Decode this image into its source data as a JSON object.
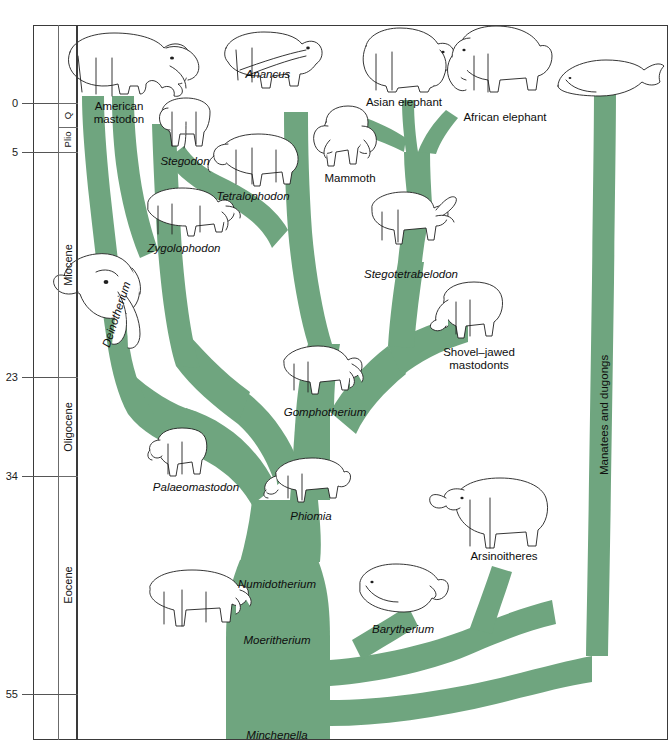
{
  "figure": {
    "kind": "phylogenetic-tree",
    "tree_color": "#6fa57f",
    "ink_color": "#1b1b1b"
  },
  "time_axis": {
    "unit_note": "millions of years ago",
    "ticks": [
      {
        "label": "0",
        "value": 0,
        "y": 103
      },
      {
        "label": "5",
        "value": 5,
        "y": 152
      },
      {
        "label": "23",
        "value": 23,
        "y": 377
      },
      {
        "label": "34",
        "value": 34,
        "y": 476
      },
      {
        "label": "55",
        "value": 55,
        "y": 694
      }
    ],
    "epochs": [
      {
        "label": "Q",
        "top": 103,
        "bottom": 127,
        "small": true
      },
      {
        "label": "Plio",
        "top": 127,
        "bottom": 152,
        "small": true
      },
      {
        "label": "Miocene",
        "top": 152,
        "bottom": 377,
        "small": false
      },
      {
        "label": "Oligocene",
        "top": 377,
        "bottom": 476,
        "small": false
      },
      {
        "label": "Eocene",
        "top": 476,
        "bottom": 694,
        "small": false
      }
    ]
  },
  "taxa": [
    {
      "name": "American\nmastodon",
      "italic": false,
      "x": 119,
      "y": 100,
      "align": "center"
    },
    {
      "name": "Anancus",
      "italic": true,
      "x": 268,
      "y": 68,
      "align": "center"
    },
    {
      "name": "Asian elephant",
      "italic": false,
      "x": 404,
      "y": 96,
      "align": "center"
    },
    {
      "name": "African elephant",
      "italic": false,
      "x": 505,
      "y": 111,
      "align": "center"
    },
    {
      "name": "Stegodon",
      "italic": true,
      "x": 185,
      "y": 155,
      "align": "center"
    },
    {
      "name": "Mammoth",
      "italic": false,
      "x": 350,
      "y": 172,
      "align": "center"
    },
    {
      "name": "Tetralophodon",
      "italic": true,
      "x": 253,
      "y": 190,
      "align": "center"
    },
    {
      "name": "Zygolophodon",
      "italic": true,
      "x": 184,
      "y": 242,
      "align": "center"
    },
    {
      "name": "Stegotetrabelodon",
      "italic": true,
      "x": 411,
      "y": 268,
      "align": "center"
    },
    {
      "name": "Shovel–jawed\nmastodonts",
      "italic": false,
      "x": 479,
      "y": 346,
      "align": "center"
    },
    {
      "name": "Gomphotherium",
      "italic": true,
      "x": 325,
      "y": 406,
      "align": "center"
    },
    {
      "name": "Palaeomastodon",
      "italic": true,
      "x": 196,
      "y": 481,
      "align": "center"
    },
    {
      "name": "Phiomia",
      "italic": true,
      "x": 311,
      "y": 510,
      "align": "center"
    },
    {
      "name": "Arsinoitheres",
      "italic": false,
      "x": 504,
      "y": 550,
      "align": "center"
    },
    {
      "name": "Numidotherium",
      "italic": true,
      "x": 277,
      "y": 578,
      "align": "center"
    },
    {
      "name": "Barytherium",
      "italic": true,
      "x": 403,
      "y": 623,
      "align": "center"
    },
    {
      "name": "Moeritherium",
      "italic": true,
      "x": 277,
      "y": 634,
      "align": "center"
    },
    {
      "name": "Minchenella",
      "italic": true,
      "x": 277,
      "y": 729,
      "align": "center"
    },
    {
      "name": "Deinotherium",
      "italic": true,
      "x": 100,
      "y": 345,
      "align": "rotated",
      "rotate": -72
    },
    {
      "name": "Manatees and dugongs",
      "italic": false,
      "x": 598,
      "y": 475,
      "align": "vertical"
    }
  ],
  "chart_data": {
    "type": "tree",
    "xlabel": "",
    "ylabel": "Millions of years ago",
    "ylim": [
      0,
      58
    ],
    "grid": false,
    "legend": "none",
    "lineages": [
      {
        "name": "American mastodon",
        "first_appearance": 23,
        "last": 0
      },
      {
        "name": "Zygolophodon",
        "first_appearance": 23,
        "last": 10
      },
      {
        "name": "Stegodon",
        "first_appearance": 12,
        "last": 1
      },
      {
        "name": "Tetralophodon",
        "first_appearance": 14,
        "last": 5
      },
      {
        "name": "Anancus",
        "first_appearance": 12,
        "last": 2
      },
      {
        "name": "Gomphotherium",
        "first_appearance": 23,
        "last": 10
      },
      {
        "name": "Shovel-jawed mastodonts",
        "first_appearance": 20,
        "last": 8
      },
      {
        "name": "Stegotetrabelodon",
        "first_appearance": 12,
        "last": 5
      },
      {
        "name": "Mammoth",
        "first_appearance": 5,
        "last": 0
      },
      {
        "name": "Asian elephant",
        "first_appearance": 5,
        "last": 0
      },
      {
        "name": "African elephant",
        "first_appearance": 5,
        "last": 0
      },
      {
        "name": "Deinotherium",
        "first_appearance": 34,
        "last": 2
      },
      {
        "name": "Palaeomastodon",
        "first_appearance": 38,
        "last": 30
      },
      {
        "name": "Phiomia",
        "first_appearance": 38,
        "last": 30
      },
      {
        "name": "Numidotherium",
        "first_appearance": 50,
        "last": 40
      },
      {
        "name": "Moeritherium",
        "first_appearance": 52,
        "last": 38
      },
      {
        "name": "Barytherium",
        "first_appearance": 53,
        "last": 40
      },
      {
        "name": "Arsinoitheres",
        "first_appearance": 54,
        "last": 28
      },
      {
        "name": "Manatees and dugongs",
        "first_appearance": 55,
        "last": 0
      },
      {
        "name": "Minchenella",
        "first_appearance": 58,
        "last": 54
      }
    ]
  }
}
